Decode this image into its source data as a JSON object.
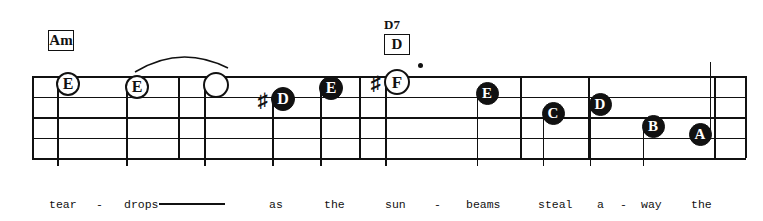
{
  "score": {
    "staff": {
      "left": 32,
      "right": 746,
      "line_top_y": 76,
      "line_spacing": 20.5,
      "line_count": 5
    },
    "chords": [
      {
        "name": "Am",
        "boxed_text": "Am",
        "above_text": "",
        "x": 48,
        "y": 30
      },
      {
        "name": "D7",
        "boxed_text": "D",
        "above_text": "D7",
        "x": 384,
        "y": 18
      }
    ],
    "barlines": [
      32,
      178,
      359,
      520,
      588,
      714,
      745
    ],
    "notes": [
      {
        "letter": "E",
        "head": "open",
        "accidental": "",
        "dotted": false,
        "x": 68,
        "y": 84,
        "stem": "down",
        "size": 24
      },
      {
        "letter": "E",
        "head": "open",
        "accidental": "",
        "dotted": false,
        "x": 137,
        "y": 87,
        "stem": "down",
        "size": 24
      },
      {
        "letter": "",
        "head": "open",
        "accidental": "",
        "dotted": false,
        "x": 216,
        "y": 85,
        "stem": "down",
        "size": 26
      },
      {
        "letter": "D",
        "head": "filled",
        "accidental": "sharp",
        "dotted": false,
        "x": 283,
        "y": 99,
        "stem": "down",
        "size": 24
      },
      {
        "letter": "E",
        "head": "filled",
        "accidental": "",
        "dotted": false,
        "x": 331,
        "y": 88,
        "stem": "down",
        "size": 24
      },
      {
        "letter": "F",
        "head": "open",
        "accidental": "sharp",
        "dotted": true,
        "x": 397,
        "y": 82,
        "stem": "down",
        "size": 26
      },
      {
        "letter": "E",
        "head": "filled",
        "accidental": "",
        "dotted": false,
        "x": 487,
        "y": 93,
        "stem": "down",
        "size": 23
      },
      {
        "letter": "C",
        "head": "filled",
        "accidental": "",
        "dotted": false,
        "x": 553,
        "y": 113,
        "stem": "down",
        "size": 23
      },
      {
        "letter": "D",
        "head": "filled",
        "accidental": "",
        "dotted": false,
        "x": 600,
        "y": 104,
        "stem": "down",
        "size": 23
      },
      {
        "letter": "B",
        "head": "filled",
        "accidental": "",
        "dotted": false,
        "x": 653,
        "y": 126,
        "stem": "down",
        "size": 23
      },
      {
        "letter": "A",
        "head": "filled",
        "accidental": "",
        "dotted": false,
        "x": 700,
        "y": 134,
        "stem": "up",
        "size": 23
      }
    ],
    "slur": {
      "from_x": 133,
      "to_x": 228,
      "apex_y": 50,
      "end_y": 72
    },
    "lyrics": [
      {
        "text": "tear",
        "x": 49
      },
      {
        "text": "-",
        "x": 96
      },
      {
        "text": "drops",
        "x": 124
      },
      {
        "text": "as",
        "x": 269
      },
      {
        "text": "the",
        "x": 324
      },
      {
        "text": "sun",
        "x": 385
      },
      {
        "text": "-",
        "x": 434
      },
      {
        "text": "beams",
        "x": 466
      },
      {
        "text": "steal",
        "x": 538
      },
      {
        "text": "a",
        "x": 597
      },
      {
        "text": "-",
        "x": 620
      },
      {
        "text": "way",
        "x": 641
      },
      {
        "text": "the",
        "x": 691
      }
    ],
    "lyric_baseline_y": 199,
    "lyric_extender": {
      "x": 159,
      "y": 203,
      "width": 66
    },
    "colors": {
      "ink": "#111111",
      "paper": "#ffffff"
    }
  }
}
